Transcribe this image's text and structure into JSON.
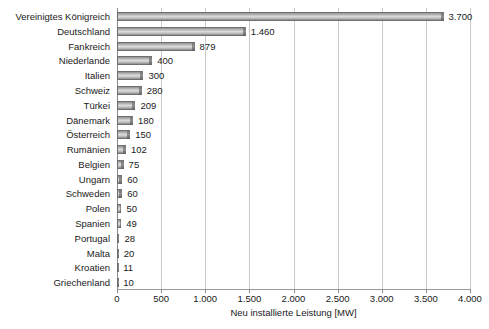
{
  "chart_data": {
    "type": "bar",
    "orientation": "horizontal",
    "title": "",
    "xlabel": "Neu installierte Leistung [MW]",
    "ylabel": "",
    "xlim": [
      0,
      4000
    ],
    "grid": true,
    "legend": false,
    "xtick_labels": [
      "0",
      "500",
      "1.000",
      "1.500",
      "2.000",
      "2.500",
      "3.000",
      "3.500",
      "4.000"
    ],
    "xtick_values": [
      0,
      500,
      1000,
      1500,
      2000,
      2500,
      3000,
      3500,
      4000
    ],
    "categories": [
      "Vereinigtes Königreich",
      "Deutschland",
      "Fankreich",
      "Niederlande",
      "Italien",
      "Schweiz",
      "Türkei",
      "Dänemark",
      "Österreich",
      "Rumänien",
      "Belgien",
      "Ungarn",
      "Schweden",
      "Polen",
      "Spanien",
      "Portugal",
      "Malta",
      "Kroatien",
      "Griechenland"
    ],
    "values": [
      3700,
      1460,
      879,
      400,
      300,
      280,
      209,
      180,
      150,
      102,
      75,
      60,
      60,
      50,
      49,
      28,
      20,
      11,
      10
    ],
    "value_labels": [
      "3.700",
      "1.460",
      "879",
      "400",
      "300",
      "280",
      "209",
      "180",
      "150",
      "102",
      "75",
      "60",
      "60",
      "50",
      "49",
      "28",
      "20",
      "11",
      "10"
    ],
    "bar_color": "#c2c2c2",
    "bar_edge_color": "#6f6f6f",
    "gridline_color": "#c9c9c9",
    "axis_color": "#8a8a8a",
    "text_color": "#1a1a1a",
    "background_color": "#ffffff"
  }
}
